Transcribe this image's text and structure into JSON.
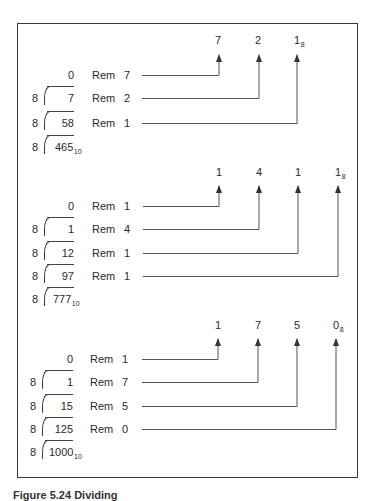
{
  "figure": {
    "caption_partial": "Figure 5.24 Dividing",
    "blocks": [
      {
        "dividend": "465",
        "dividend_base": "10",
        "divisor": "8",
        "result_digits": [
          "7",
          "2",
          "1"
        ],
        "result_base": "8",
        "rows": [
          {
            "divisor": "",
            "quotient": "0",
            "rem_label": "Rem",
            "remainder": "7"
          },
          {
            "divisor": "8",
            "quotient": "7",
            "rem_label": "Rem",
            "remainder": "2"
          },
          {
            "divisor": "8",
            "quotient": "58",
            "rem_label": "Rem",
            "remainder": "1"
          }
        ]
      },
      {
        "dividend": "777",
        "dividend_base": "10",
        "divisor": "8",
        "result_digits": [
          "1",
          "4",
          "1",
          "1"
        ],
        "result_base": "8",
        "rows": [
          {
            "divisor": "",
            "quotient": "0",
            "rem_label": "Rem",
            "remainder": "1"
          },
          {
            "divisor": "8",
            "quotient": "1",
            "rem_label": "Rem",
            "remainder": "4"
          },
          {
            "divisor": "8",
            "quotient": "12",
            "rem_label": "Rem",
            "remainder": "1"
          },
          {
            "divisor": "8",
            "quotient": "97",
            "rem_label": "Rem",
            "remainder": "1"
          }
        ]
      },
      {
        "dividend": "1000",
        "dividend_base": "10",
        "divisor": "8",
        "result_digits": [
          "1",
          "7",
          "5",
          "0"
        ],
        "result_base": "8",
        "rows": [
          {
            "divisor": "",
            "quotient": "0",
            "rem_label": "Rem",
            "remainder": "1"
          },
          {
            "divisor": "8",
            "quotient": "1",
            "rem_label": "Rem",
            "remainder": "7"
          },
          {
            "divisor": "8",
            "quotient": "15",
            "rem_label": "Rem",
            "remainder": "5"
          },
          {
            "divisor": "8",
            "quotient": "125",
            "rem_label": "Rem",
            "remainder": "0"
          }
        ]
      }
    ]
  }
}
